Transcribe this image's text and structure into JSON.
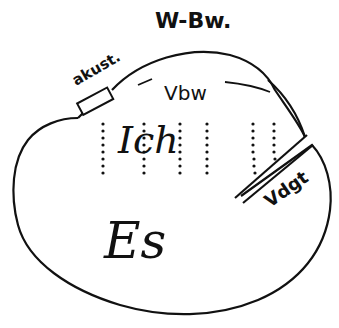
{
  "diagram": {
    "labels": {
      "perception_consciousness": "W-Bw.",
      "acoustic": "akust.",
      "preconscious": "Vbw",
      "ego": "Ich",
      "id": "Es",
      "repressed": "Vdgt"
    },
    "colors": {
      "ink": "#111111",
      "background": "#ffffff"
    }
  }
}
